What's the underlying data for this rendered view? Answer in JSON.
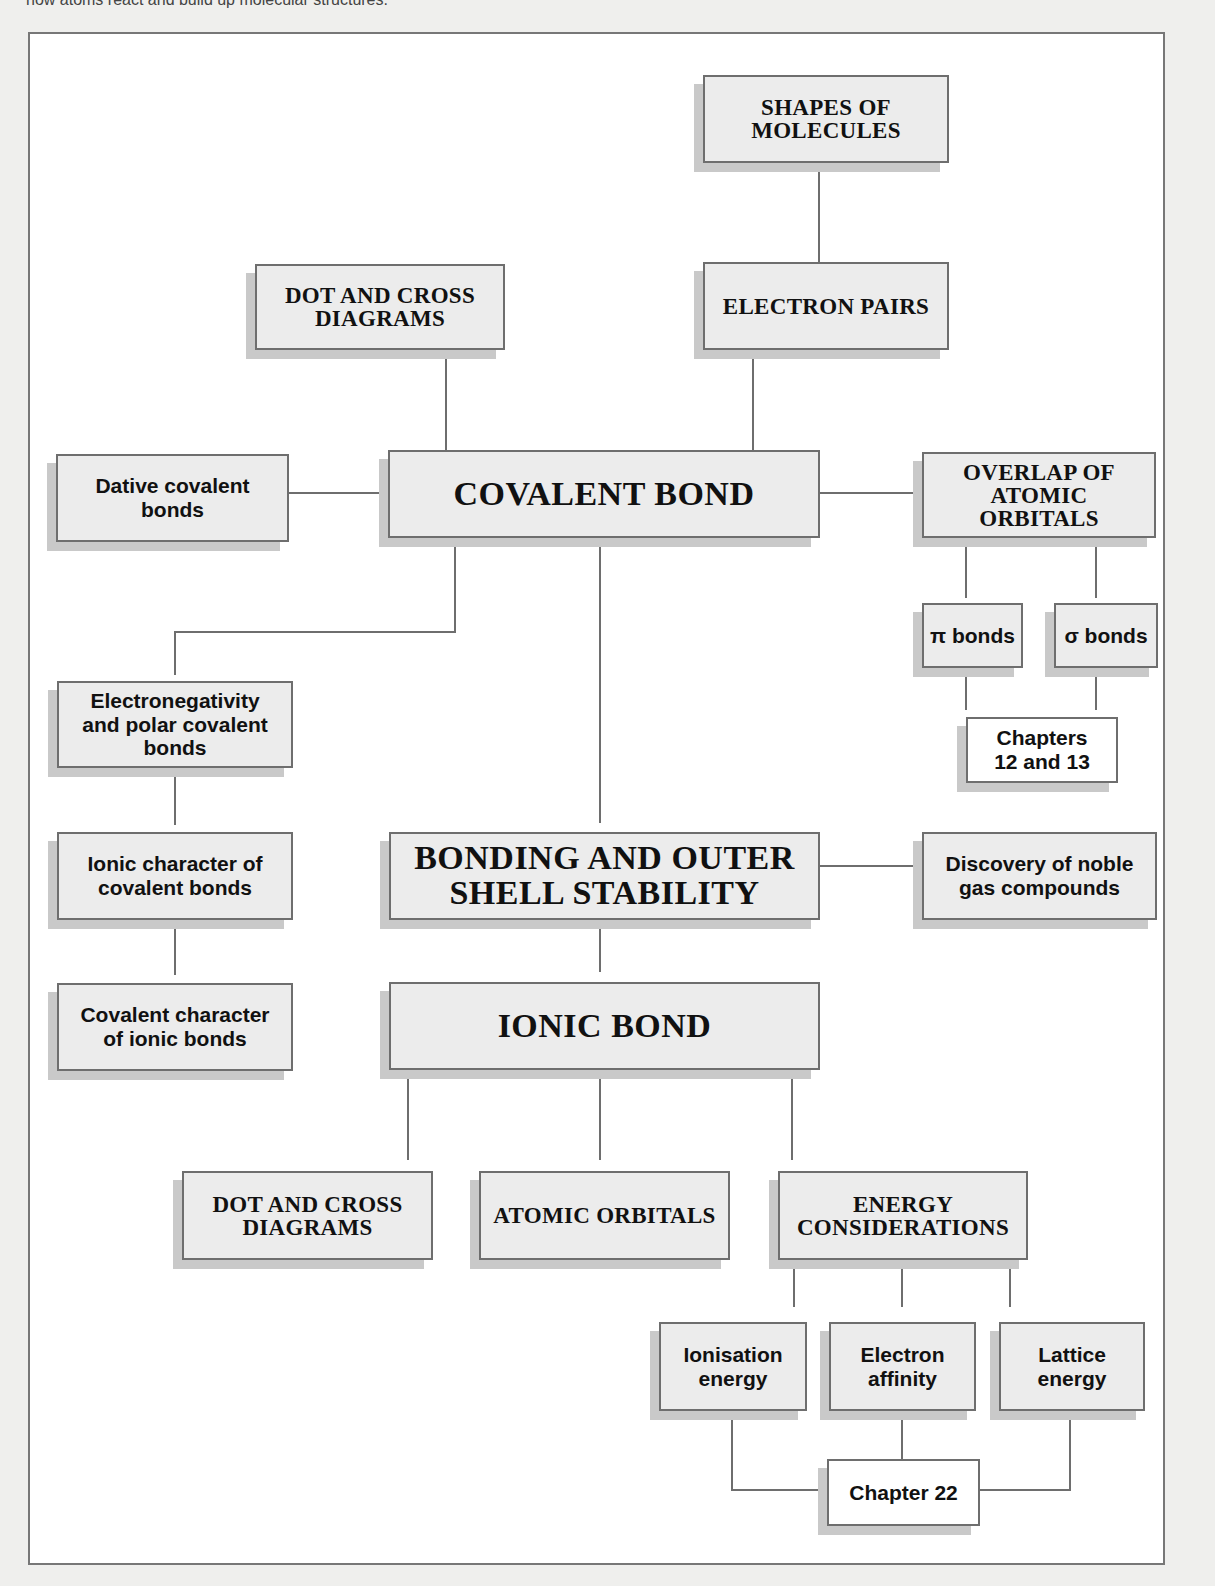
{
  "caption": "how atoms react and build up molecular structures.",
  "diagram": {
    "title_node": "BONDING AND OUTER\nSHELL STABILITY",
    "nodes": {
      "shapes_of_molecules": "SHAPES OF\nMOLECULES",
      "electron_pairs": "ELECTRON PAIRS",
      "dot_cross_covalent": "DOT AND CROSS\nDIAGRAMS",
      "dative_covalent": "Dative covalent\nbonds",
      "covalent_bond": "COVALENT BOND",
      "overlap_orbitals": "OVERLAP OF\nATOMIC\nORBITALS",
      "pi_bonds": "π bonds",
      "sigma_bonds": "σ bonds",
      "chapters_12_13": "Chapters\n12 and 13",
      "electronegativity": "Electronegativity\nand polar covalent\nbonds",
      "ionic_character": "Ionic character of\ncovalent bonds",
      "covalent_character": "Covalent character\nof ionic bonds",
      "bonding_outer_shell": "BONDING AND OUTER\nSHELL STABILITY",
      "noble_gas": "Discovery of noble\ngas compounds",
      "ionic_bond": "IONIC BOND",
      "dot_cross_ionic": "DOT AND CROSS\nDIAGRAMS",
      "atomic_orbitals": "ATOMIC ORBITALS",
      "energy_considerations": "ENERGY\nCONSIDERATIONS",
      "ionisation_energy": "Ionisation\nenergy",
      "electron_affinity": "Electron\naffinity",
      "lattice_energy": "Lattice\nenergy",
      "chapter_22": "Chapter 22"
    },
    "colors": {
      "box_fill": "#ececec",
      "box_border": "#6e6e6e",
      "shadow": "#c9c9c9",
      "line": "#6e6e6e"
    }
  }
}
